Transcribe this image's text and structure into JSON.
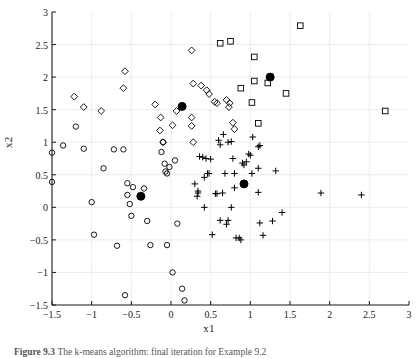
{
  "figure": {
    "caption_label": "Figure 9.3",
    "caption_text": "The k-means algorithm: final iteration for Example 9.2",
    "background_color": "#ffffff",
    "axis_color": "#1a1a1a",
    "grid_color": "#e8e8e8",
    "marker_color": "#000000"
  },
  "chart_data": {
    "type": "scatter",
    "title": "",
    "xlabel": "x1",
    "ylabel": "x2",
    "xlim": [
      -1.5,
      3
    ],
    "ylim": [
      -1.5,
      3
    ],
    "xticks": [
      -1.5,
      -1,
      -0.5,
      0,
      0.5,
      1,
      1.5,
      2,
      2.5,
      3
    ],
    "xticklabels": [
      "−1.5",
      "−1",
      "−0.5",
      "0",
      "0.5",
      "1",
      "1.5",
      "2",
      "2.5",
      "3"
    ],
    "yticks": [
      -1.5,
      -1,
      -0.5,
      0,
      0.5,
      1,
      1.5,
      2,
      2.5,
      3
    ],
    "yticklabels": [
      "−1.5",
      "−1",
      "−0.5",
      "0",
      "0.5",
      "1",
      "1.5",
      "2",
      "2.5",
      "3"
    ],
    "grid": true,
    "legend": null,
    "series": [
      {
        "name": "cluster-circle",
        "marker": "circle",
        "filled": false,
        "points": [
          [
            -1.5,
            0.84
          ],
          [
            -1.5,
            0.39
          ],
          [
            -1.36,
            0.95
          ],
          [
            -1.2,
            1.24
          ],
          [
            -1.1,
            0.9
          ],
          [
            -1.0,
            0.08
          ],
          [
            -0.97,
            -0.42
          ],
          [
            -0.85,
            0.6
          ],
          [
            -0.72,
            0.89
          ],
          [
            -0.68,
            -0.59
          ],
          [
            -0.6,
            0.89
          ],
          [
            -0.58,
            -1.35
          ],
          [
            -0.55,
            0.37
          ],
          [
            -0.55,
            0.19
          ],
          [
            -0.52,
            0.05
          ],
          [
            -0.5,
            -0.13
          ],
          [
            -0.48,
            0.31
          ],
          [
            -0.34,
            0.29
          ],
          [
            -0.3,
            -0.21
          ],
          [
            -0.26,
            -0.58
          ],
          [
            -0.12,
            0.85
          ],
          [
            -0.1,
            1.0
          ],
          [
            -0.08,
            0.67
          ],
          [
            -0.07,
            0.55
          ],
          [
            -0.05,
            0.52
          ],
          [
            -0.05,
            -0.58
          ],
          [
            -0.02,
            0.62
          ],
          [
            0.02,
            -1.0
          ],
          [
            0.05,
            0.72
          ],
          [
            0.08,
            -0.25
          ],
          [
            0.14,
            -1.25
          ],
          [
            0.17,
            -1.43
          ]
        ]
      },
      {
        "name": "cluster-diamond",
        "marker": "diamond",
        "filled": false,
        "points": [
          [
            -1.22,
            1.7
          ],
          [
            -1.1,
            1.54
          ],
          [
            -0.88,
            1.48
          ],
          [
            -0.58,
            2.09
          ],
          [
            -0.6,
            1.83
          ],
          [
            -0.2,
            1.58
          ],
          [
            -0.13,
            1.38
          ],
          [
            -0.14,
            1.18
          ],
          [
            -0.1,
            1.0
          ],
          [
            0.02,
            1.26
          ],
          [
            0.07,
            1.48
          ],
          [
            0.14,
            1.55
          ],
          [
            0.26,
            2.41
          ],
          [
            0.28,
            1.9
          ],
          [
            0.26,
            1.38
          ],
          [
            0.26,
            1.25
          ],
          [
            0.28,
            1.0
          ],
          [
            0.38,
            1.87
          ],
          [
            0.45,
            1.8
          ],
          [
            0.48,
            1.74
          ],
          [
            0.55,
            1.62
          ],
          [
            0.58,
            1.6
          ],
          [
            0.7,
            1.65
          ],
          [
            0.73,
            1.54
          ],
          [
            0.74,
            1.6
          ],
          [
            0.78,
            1.3
          ],
          [
            0.8,
            1.2
          ]
        ]
      },
      {
        "name": "cluster-square",
        "marker": "square",
        "filled": false,
        "points": [
          [
            0.62,
            2.52
          ],
          [
            0.75,
            2.55
          ],
          [
            1.05,
            2.31
          ],
          [
            0.88,
            1.83
          ],
          [
            1.05,
            1.94
          ],
          [
            1.22,
            1.91
          ],
          [
            1.02,
            1.61
          ],
          [
            1.1,
            1.29
          ],
          [
            1.45,
            1.75
          ],
          [
            1.63,
            2.79
          ],
          [
            2.7,
            1.48
          ]
        ]
      },
      {
        "name": "cluster-plus",
        "marker": "plus",
        "filled": false,
        "points": [
          [
            0.3,
            0.36
          ],
          [
            0.33,
            0.17
          ],
          [
            0.34,
            0.22
          ],
          [
            0.34,
            0.25
          ],
          [
            0.36,
            0.78
          ],
          [
            0.4,
            0.77
          ],
          [
            0.42,
            0.46
          ],
          [
            0.44,
            0.75
          ],
          [
            0.42,
            0.0
          ],
          [
            0.46,
            0.52
          ],
          [
            0.48,
            0.52
          ],
          [
            0.5,
            0.74
          ],
          [
            0.52,
            -0.42
          ],
          [
            0.56,
            0.21
          ],
          [
            0.58,
            0.21
          ],
          [
            0.6,
            1.03
          ],
          [
            0.62,
            0.96
          ],
          [
            0.66,
            1.12
          ],
          [
            0.62,
            -0.2
          ],
          [
            0.65,
            0.22
          ],
          [
            0.68,
            0.52
          ],
          [
            0.7,
            -0.26
          ],
          [
            0.72,
            -0.2
          ],
          [
            0.72,
            1.0
          ],
          [
            0.76,
            1.01
          ],
          [
            0.76,
            0.0
          ],
          [
            0.78,
            0.75
          ],
          [
            0.8,
            0.52
          ],
          [
            0.8,
            0.3
          ],
          [
            0.82,
            -0.47
          ],
          [
            0.86,
            -0.47
          ],
          [
            0.88,
            -0.5
          ],
          [
            0.9,
            0.68
          ],
          [
            0.92,
            0.65
          ],
          [
            0.95,
            0.7
          ],
          [
            0.98,
            0.82
          ],
          [
            1.0,
            0.8
          ],
          [
            1.02,
            0.52
          ],
          [
            1.03,
            1.08
          ],
          [
            1.1,
            0.93
          ],
          [
            1.12,
            0.95
          ],
          [
            1.1,
            0.6
          ],
          [
            1.1,
            0.23
          ],
          [
            1.12,
            -0.24
          ],
          [
            1.16,
            -0.43
          ],
          [
            1.28,
            -0.21
          ],
          [
            1.32,
            0.56
          ],
          [
            1.4,
            -0.08
          ],
          [
            1.89,
            0.22
          ],
          [
            2.4,
            0.19
          ]
        ]
      },
      {
        "name": "centroids",
        "marker": "circle",
        "filled": true,
        "points": [
          [
            -0.38,
            0.17
          ],
          [
            0.14,
            1.55
          ],
          [
            0.92,
            0.36
          ],
          [
            1.25,
            2.0
          ]
        ]
      }
    ]
  }
}
